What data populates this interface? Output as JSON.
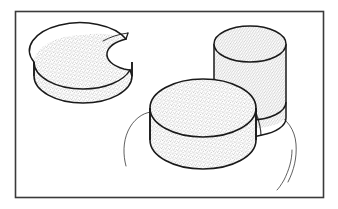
{
  "figure": {
    "medium": "scanned pen-and-ink technical drawing",
    "projection": "oblique / isometric pictorial view",
    "canvas": {
      "width": 338,
      "height": 209,
      "background_color": "#ffffff"
    },
    "frame": {
      "name": "rectangular border frame",
      "x": 15,
      "y": 11,
      "width": 308,
      "height": 186,
      "stroke_color": "#3a3a3a",
      "stroke_width": 1.6,
      "fill": "none"
    },
    "ink_color": "#1a1a1a",
    "stipple": {
      "description": "fine grey dot stipple shading fill on all solid surfaces",
      "dot_color": "#6e6e6e",
      "dot_radius": 0.38,
      "spacing": 2.0,
      "background_color": "#ffffff"
    },
    "shapes": [
      {
        "id": "notched-cylinder",
        "name": "cylinder with circular notch cut from top right",
        "description": "A short right circular cylinder seen in oblique view; a smaller circular cylinder has been subtracted from its upper right quadrant leaving a crescent / pac-man shaped top face and a concave cut wall.",
        "operation": "subtract",
        "top_face": {
          "center_x": 83,
          "center_y": 62,
          "radius_x": 49,
          "radius_y": 27
        },
        "height": 35,
        "cut": {
          "name": "circular notch",
          "center_x": 122,
          "center_y": 52,
          "radius_x": 24,
          "radius_y": 14
        },
        "bounds": {
          "x": 33,
          "y": 31,
          "width": 100,
          "height": 78
        }
      },
      {
        "id": "wide-disc-cylinder",
        "name": "wide flat cylinder in foreground",
        "description": "A broad low right circular cylinder (disc) resting in front, stipple shaded, occluding the base of the tall cylinder.",
        "operation": "solid",
        "top_face": {
          "center_x": 203,
          "center_y": 108,
          "radius_x": 53,
          "radius_y": 29
        },
        "height": 40,
        "bounds": {
          "x": 150,
          "y": 78,
          "width": 106,
          "height": 98
        }
      },
      {
        "id": "tall-cylinder",
        "name": "tall narrow cylinder behind",
        "description": "A taller, narrower right circular cylinder standing behind and to the right, partially hidden by the wide disc.",
        "operation": "solid",
        "top_face": {
          "center_x": 250,
          "center_y": 44,
          "radius_x": 36,
          "radius_y": 18
        },
        "height": 58,
        "bounds": {
          "x": 214,
          "y": 26,
          "width": 72,
          "height": 120
        }
      }
    ],
    "construction_lines": [
      {
        "id": "base-circle-arc-left",
        "name": "thin construction arc at left of group",
        "description": "Faint thin arc sweeping from behind the left edge of the wide disc down and around, indicating a larger underlying circle.",
        "stroke_width": 0.7
      },
      {
        "id": "base-circle-arc-right-outer",
        "name": "thin construction arc at right of group, outer",
        "description": "Faint thin arc on the right side curving down past the tall cylinder base.",
        "stroke_width": 0.7
      },
      {
        "id": "base-circle-arc-right-inner",
        "name": "thin construction arc at right of group, inner tail",
        "description": "Second shorter faint arc running parallel just inside the outer right arc, terminating in a free tail.",
        "stroke_width": 0.7
      }
    ],
    "labels": [],
    "annotations": []
  }
}
